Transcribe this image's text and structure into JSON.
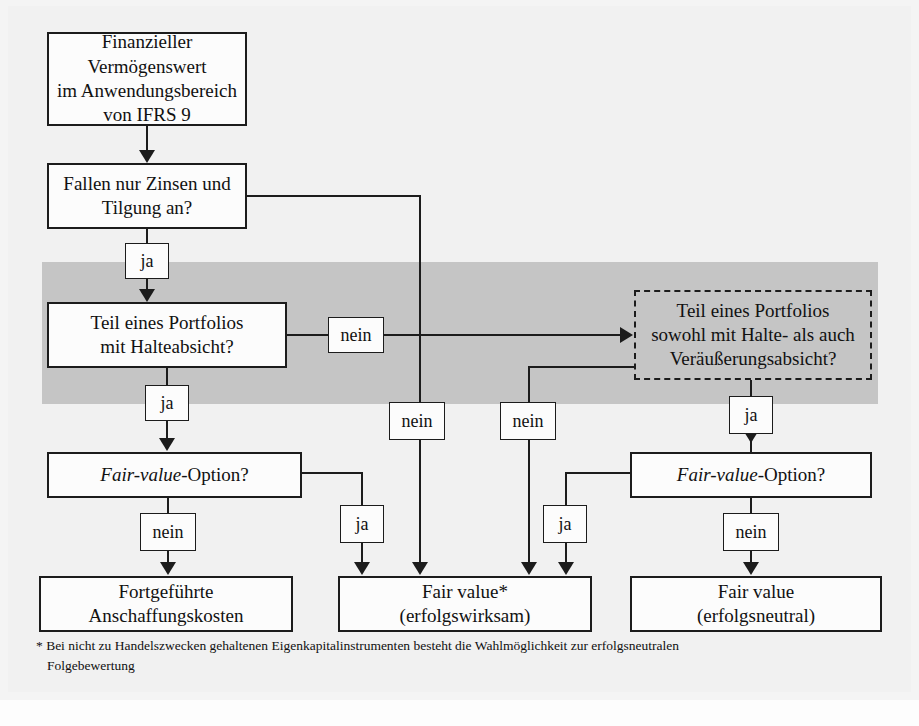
{
  "diagram": {
    "colors": {
      "band": "#c5c5c5",
      "line": "#1c1c1c",
      "box_fill": "#fcfcfc",
      "page": "#f1f1f1"
    },
    "nodes": [
      {
        "id": "start",
        "lines": [
          "Finanzieller Vermögenswert",
          "im Anwendungsbereich",
          "von IFRS 9"
        ]
      },
      {
        "id": "spi",
        "lines": [
          "Fallen nur Zinsen und",
          "Tilgung an?"
        ]
      },
      {
        "id": "hold",
        "lines": [
          "Teil eines Portfolios",
          "mit Halteabsicht?"
        ]
      },
      {
        "id": "hold-sell",
        "lines": [
          "Teil eines Portfolios",
          "sowohl mit Halte- als auch",
          "Veräußerungsabsicht?"
        ],
        "style": "dashed"
      },
      {
        "id": "fvo-left",
        "lines": [
          "Fair-value-Option?"
        ],
        "italic_part": "Fair-value",
        "roman_part": "-Option?"
      },
      {
        "id": "fvo-right",
        "lines": [
          "Fair-value-Option?"
        ],
        "italic_part": "Fair-value",
        "roman_part": "-Option?"
      },
      {
        "id": "amortised",
        "lines": [
          "Fortgeführte",
          "Anschaffungskosten"
        ]
      },
      {
        "id": "fv-pl",
        "lines": [
          "Fair value*",
          "(erfolgswirksam)"
        ]
      },
      {
        "id": "fv-oci",
        "lines": [
          "Fair value",
          "(erfolgsneutral)"
        ]
      }
    ],
    "edge_labels": [
      {
        "id": "lbl-spi-ja",
        "text": "ja"
      },
      {
        "id": "lbl-spi-nein",
        "text": "nein"
      },
      {
        "id": "lbl-hold-ja",
        "text": "ja"
      },
      {
        "id": "lbl-hold-nein",
        "text": "nein"
      },
      {
        "id": "lbl-holdsell-nein",
        "text": "nein"
      },
      {
        "id": "lbl-holdsell-ja",
        "text": "ja"
      },
      {
        "id": "lbl-fvoleft-nein",
        "text": "nein"
      },
      {
        "id": "lbl-fvoleft-ja",
        "text": "ja"
      },
      {
        "id": "lbl-fvoright-ja",
        "text": "ja"
      },
      {
        "id": "lbl-fvoright-nein",
        "text": "nein"
      }
    ],
    "footnote": {
      "line1": "* Bei nicht zu Handelszwecken gehaltenen Eigenkapitalinstrumenten besteht die Wahlmöglichkeit zur erfolgsneutralen",
      "line2": "Folgebewertung"
    }
  }
}
